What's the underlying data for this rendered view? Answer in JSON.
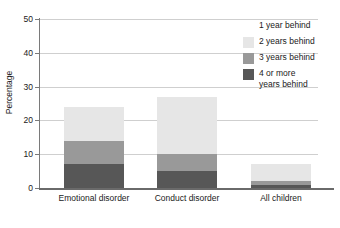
{
  "chart_data": {
    "type": "bar",
    "subtype": "stacked-bar",
    "title": "",
    "xlabel": "",
    "ylabel": "Percentage",
    "ylim": [
      0,
      50
    ],
    "yticks": [
      0,
      10,
      20,
      30,
      40,
      50
    ],
    "ytick_labels": [
      "0",
      "10",
      "20",
      "30",
      "40",
      "50"
    ],
    "grid": true,
    "grid_axis": "y",
    "legend_position": "right",
    "categories": [
      "Emotional disorder",
      "Conduct disorder",
      "All children"
    ],
    "series": [
      {
        "name": "1 year behind",
        "color": "#ffffff",
        "values": [
          0,
          0,
          0
        ]
      },
      {
        "name": "2 years behind",
        "color": "#e6e6e6",
        "values": [
          10,
          17,
          5
        ]
      },
      {
        "name": "3 years behind",
        "color": "#999999",
        "values": [
          7,
          5,
          1
        ]
      },
      {
        "name": "4 or more\nyears behind",
        "color": "#575757",
        "values": [
          7,
          5,
          1
        ]
      }
    ],
    "totals": [
      24,
      27,
      7
    ],
    "annotations": []
  },
  "axis": {
    "y_title": "Percentage",
    "y_tick_0": "0",
    "y_tick_1": "10",
    "y_tick_2": "20",
    "y_tick_3": "30",
    "y_tick_4": "40",
    "y_tick_5": "50",
    "x_tick_0": "Emotional disorder",
    "x_tick_1": "Conduct disorder",
    "x_tick_2": "All children"
  },
  "legend": {
    "items": [
      {
        "label": "1 year behind",
        "color": "#ffffff"
      },
      {
        "label": "2 years behind",
        "color": "#e6e6e6"
      },
      {
        "label": "3 years behind",
        "color": "#999999"
      },
      {
        "label": "4 or more\nyears behind",
        "color": "#575757"
      }
    ]
  },
  "colors": {
    "axis": "#6a6a6a",
    "grid": "#cfcfcf",
    "text": "#1a1a1a",
    "background": "#ffffff"
  }
}
